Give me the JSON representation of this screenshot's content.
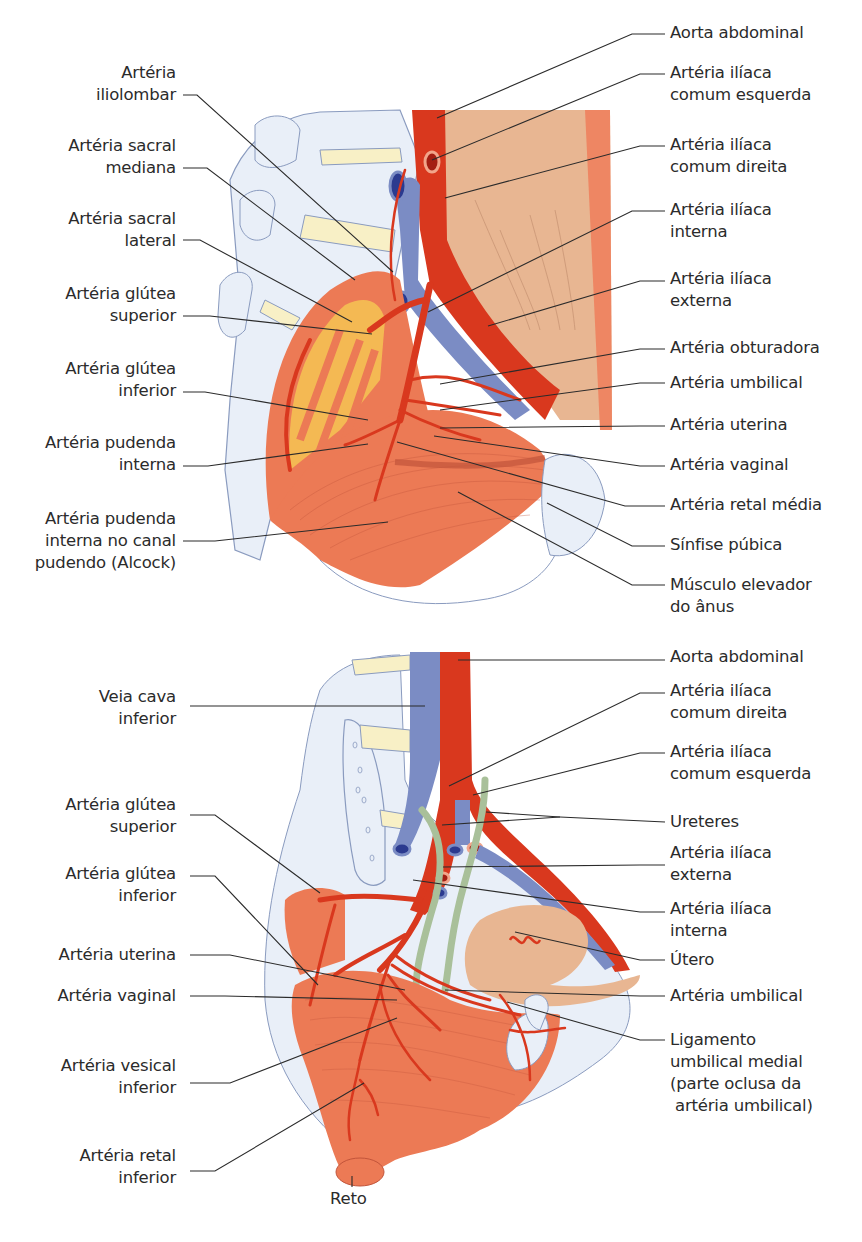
{
  "figure": {
    "top_panel": {
      "left_labels": [
        {
          "text": "Artéria\niliolombar"
        },
        {
          "text": "Artéria sacral\nmediana"
        },
        {
          "text": "Artéria sacral\nlateral"
        },
        {
          "text": "Artéria glútea\nsuperior"
        },
        {
          "text": "Artéria glútea\ninferior"
        },
        {
          "text": "Artéria pudenda\ninterna"
        },
        {
          "text": "Artéria pudenda\ninterna no canal\npudendo (Alcock)"
        }
      ],
      "right_labels": [
        {
          "text": "Aorta abdominal"
        },
        {
          "text": "Artéria ilíaca\ncomum esquerda"
        },
        {
          "text": "Artéria ilíaca\ncomum direita"
        },
        {
          "text": "Artéria ilíaca\ninterna"
        },
        {
          "text": "Artéria ilíaca\nexterna"
        },
        {
          "text": "Artéria obturadora"
        },
        {
          "text": "Artéria umbilical"
        },
        {
          "text": "Artéria uterina"
        },
        {
          "text": "Artéria vaginal"
        },
        {
          "text": "Artéria retal média"
        },
        {
          "text": "Sínfise púbica"
        },
        {
          "text": "Músculo elevador\ndo ânus"
        }
      ]
    },
    "bottom_panel": {
      "left_labels": [
        {
          "text": "Veia cava\ninferior"
        },
        {
          "text": "Artéria glútea\nsuperior"
        },
        {
          "text": "Artéria glútea\ninferior"
        },
        {
          "text": "Artéria uterina"
        },
        {
          "text": "Artéria vaginal"
        },
        {
          "text": "Artéria vesical\ninferior"
        },
        {
          "text": "Artéria retal\ninferior"
        }
      ],
      "right_labels": [
        {
          "text": "Aorta abdominal"
        },
        {
          "text": "Artéria ilíaca\ncomum direita"
        },
        {
          "text": "Artéria ilíaca\ncomum esquerda"
        },
        {
          "text": "Ureteres"
        },
        {
          "text": "Artéria ilíaca\nexterna"
        },
        {
          "text": "Artéria ilíaca\ninterna"
        },
        {
          "text": "Útero"
        },
        {
          "text": "Artéria umbilical"
        },
        {
          "text": "Ligamento\numbilical medial\n(parte oclusa da\n artéria umbilical)"
        }
      ],
      "bottom_label": {
        "text": "Reto"
      }
    },
    "caption_partial": "",
    "colors": {
      "artery": "#d9381e",
      "vein": "#7b8cc4",
      "muscle": "#ec7a55",
      "muscle_light": "#efa07e",
      "bone": "#e8eef8",
      "bone_outline": "#8a9bbf",
      "disc": "#f8f0c6",
      "skin_tissue": "#e9b494",
      "nerve_yellow": "#f6c453",
      "ureter": "#a9c09a",
      "leader_line": "#2b2b2b"
    }
  }
}
